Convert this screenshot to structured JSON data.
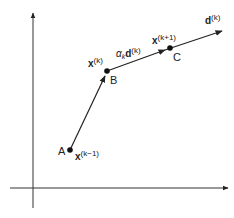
{
  "diagram": {
    "points": [
      {
        "id": "A",
        "label": "A",
        "symbol": "x",
        "superscript": "(k−1)",
        "x": 70,
        "y": 150
      },
      {
        "id": "B",
        "label": "B",
        "symbol": "x",
        "superscript": "(k)",
        "x": 107,
        "y": 71
      },
      {
        "id": "C",
        "label": "C",
        "symbol": "x",
        "superscript": "(k+1)",
        "x": 170,
        "y": 48
      }
    ],
    "step_label": {
      "alpha": "α",
      "alpha_sub": "k",
      "vector": "d",
      "superscript": "(k)"
    },
    "direction_label": {
      "vector": "d",
      "superscript": "(k)"
    },
    "colors": {
      "line": "#222222",
      "background": "#ffffff"
    }
  }
}
